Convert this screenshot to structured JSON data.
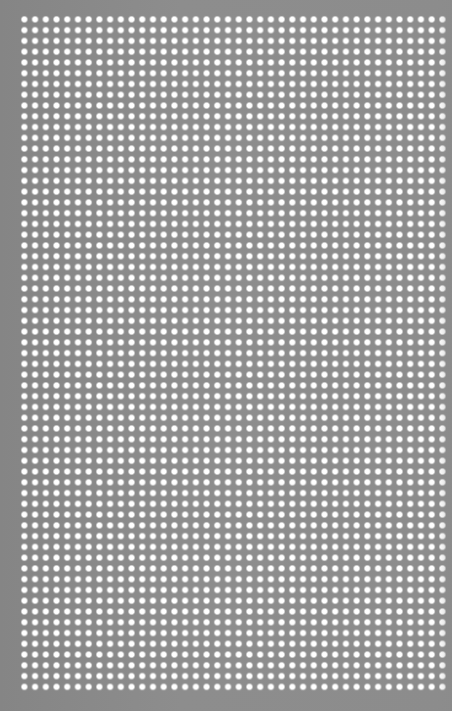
{
  "image": {
    "description": "Perforated gray metal sheet texture with a regular grid of white dots",
    "background_color": "#8b8b8b",
    "dot_color": "#ffffff",
    "grid": {
      "columns": 40,
      "rows": 63,
      "pitch_x_px": 10.72,
      "pitch_y_px": 10.78,
      "origin_x_px": 24,
      "origin_y_px": 19.5
    }
  }
}
